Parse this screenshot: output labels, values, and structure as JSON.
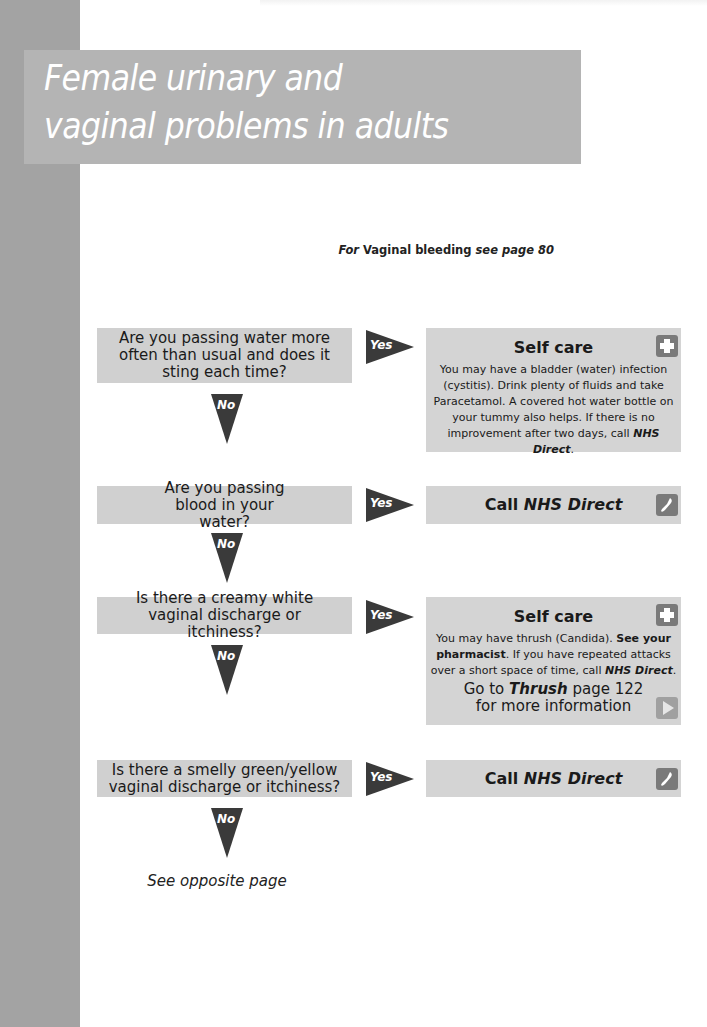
{
  "page": {
    "title_lines": [
      "Female urinary and",
      "vaginal problems in adults"
    ],
    "crossref": {
      "prefix": "For",
      "topic": "Vaginal bleeding",
      "see": "see page 80"
    },
    "colors": {
      "side_strip": "#a3a3a3",
      "title_band": "#b4b4b4",
      "question_box": "#d0d0d0",
      "answer_box": "#d4d4d4",
      "arrow": "#3a3a3a",
      "icon": "#7a7a7a"
    }
  },
  "flow": {
    "yes_label": "Yes",
    "no_label": "No",
    "steps": [
      {
        "question": "Are you passing water more often than usual and does it sting each time?",
        "answer": {
          "heading": "Self care",
          "icon": "plus-icon",
          "body": "You may have a bladder (water) infection (cystitis). Drink plenty of fluids and take Paracetamol. A covered hot water bottle on your tummy also helps. If there is no improvement after two days, call",
          "body_emphasis": "NHS Direct",
          "body_end": "."
        }
      },
      {
        "question": "Are you passing blood in your water?",
        "answer": {
          "heading_prefix": "Call",
          "heading_emphasis": "NHS Direct",
          "icon": "phone-icon"
        }
      },
      {
        "question": "Is there a creamy white vaginal discharge or itchiness?",
        "answer": {
          "heading": "Self care",
          "icon": "plus-icon",
          "body_start": "You may have thrush (Candida).",
          "body_bold": "See your pharmacist",
          "body_mid": ". If you have repeated attacks over a short space of time, call",
          "body_emphasis": "NHS Direct",
          "body_end": ".",
          "more_prefix": "Go to",
          "more_topic": "Thrush",
          "more_page": "page 122",
          "more_suffix": "for more information",
          "more_icon": "play-icon"
        }
      },
      {
        "question": "Is there a smelly green/yellow vaginal discharge or itchiness?",
        "answer": {
          "heading_prefix": "Call",
          "heading_emphasis": "NHS Direct",
          "icon": "phone-icon"
        }
      }
    ],
    "final_note": "See opposite page"
  }
}
